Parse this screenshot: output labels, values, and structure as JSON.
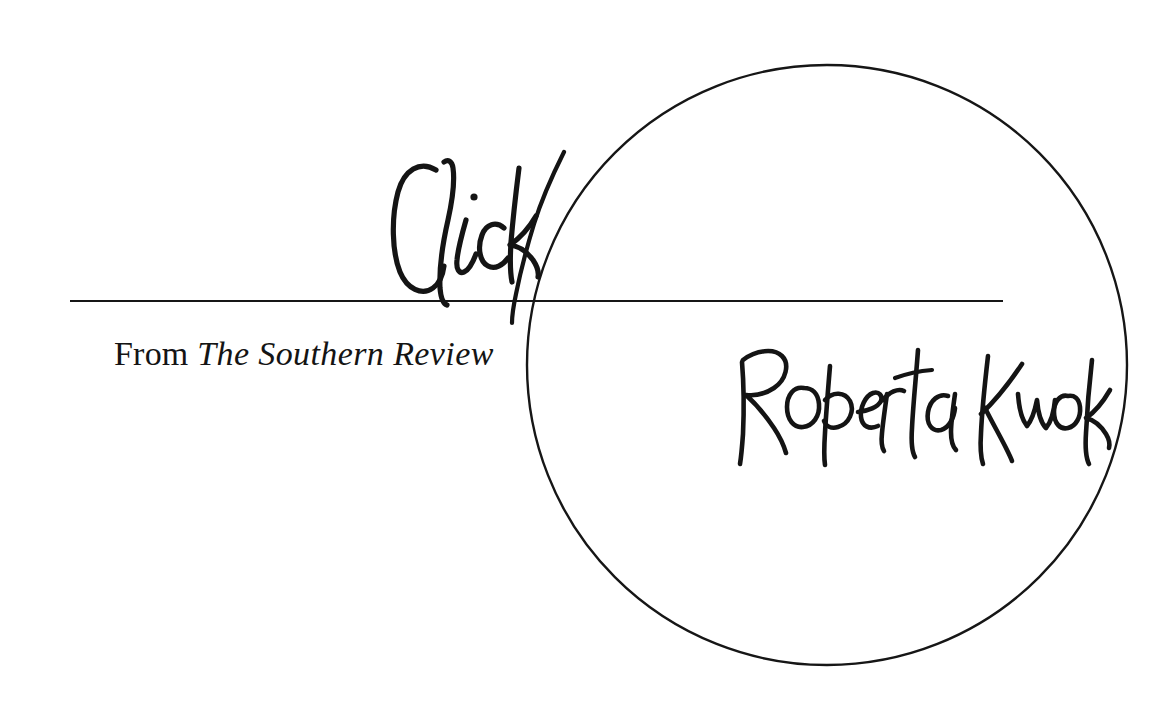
{
  "page": {
    "background_color": "#ffffff",
    "ink_color": "#141414",
    "width": 1176,
    "height": 722
  },
  "title": {
    "text": "Click",
    "style": "handwritten-script"
  },
  "source": {
    "prefix": "From",
    "publication": "The Southern Review",
    "full_text": "From The Southern Review"
  },
  "author": {
    "name": "Roberta Kwok",
    "style": "handwritten-script"
  },
  "decoration": {
    "circle": {
      "name": "large-outline-circle",
      "center_x": 827,
      "center_y": 365,
      "radius": 300,
      "stroke_width": 2.4,
      "stroke_color": "#161616"
    },
    "rule": {
      "name": "horizontal-rule",
      "x": 70,
      "y": 300,
      "width": 933,
      "thickness": 2,
      "color": "#161616"
    }
  }
}
